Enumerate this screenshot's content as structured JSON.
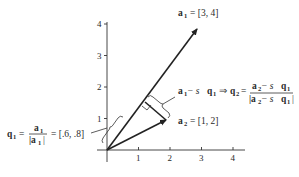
{
  "figure": {
    "type": "gram-schmidt-vector-diagram",
    "axes": {
      "x_ticks": [
        "1",
        "2",
        "3",
        "4"
      ],
      "y_ticks": [
        "1",
        "2",
        "3",
        "4"
      ]
    },
    "vectors": {
      "a1": {
        "name": "a",
        "subscript": "1",
        "value": "= [3, 4]"
      },
      "a2": {
        "name": "a",
        "subscript": "2",
        "value": "= [1, 2]"
      }
    },
    "annotations": {
      "q1": {
        "lhs": "q",
        "lhs_sub": "1",
        "eq": "=",
        "num": "a",
        "num_sub": "1",
        "den": "|a",
        "den_sub": "1",
        "den_close": "|",
        "result": "= [.6, .8]"
      },
      "q2": {
        "left": "a",
        "left_sub": "1",
        "minus": " − s",
        "q": "q",
        "q_sub": "1",
        "arrow": "⇒",
        "lhs": "q",
        "lhs_sub": "2",
        "eq": "=",
        "num": "a",
        "num_sub": "2",
        "num_rest": " − s",
        "num_q": "q",
        "num_q_sub": "1",
        "den_open": "|a",
        "den_sub": "2",
        "den_rest": " − s",
        "den_q": "q",
        "den_q_sub": "1",
        "den_close": "|"
      }
    }
  }
}
